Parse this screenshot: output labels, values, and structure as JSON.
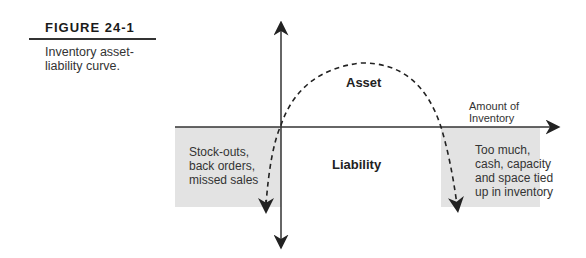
{
  "figure": {
    "label": "FIGURE 24-1",
    "caption": "Inventory asset-liability curve."
  },
  "diagram": {
    "regions": {
      "asset": "Asset",
      "liability": "Liability"
    },
    "axis_label_x_line1": "Amount of",
    "axis_label_x_line2": "Inventory",
    "left_box": [
      "Stock-outs,",
      "back orders,",
      "missed sales"
    ],
    "right_box": [
      "Too much,",
      "cash, capacity",
      "and space tied",
      "up in inventory"
    ],
    "colors": {
      "shade": "#e3e3e3",
      "line": "#333333"
    }
  }
}
